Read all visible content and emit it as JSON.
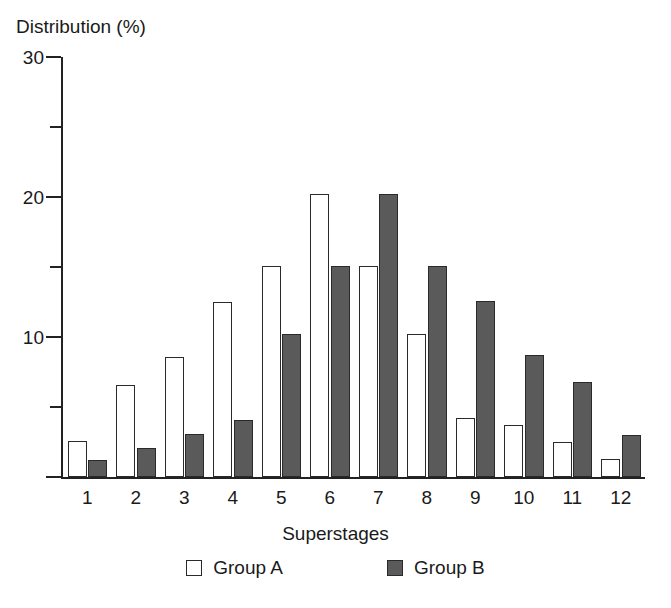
{
  "chart_data": {
    "type": "bar",
    "title": "",
    "xlabel": "Superstages",
    "ylabel": "Distribution (%)",
    "categories": [
      "1",
      "2",
      "3",
      "4",
      "5",
      "6",
      "7",
      "8",
      "9",
      "10",
      "11",
      "12"
    ],
    "series": [
      {
        "name": "Group A",
        "color": "#ffffff",
        "values": [
          2.6,
          6.6,
          8.6,
          12.5,
          15.1,
          20.2,
          15.1,
          10.2,
          4.2,
          3.7,
          2.5,
          1.3
        ]
      },
      {
        "name": "Group B",
        "color": "#5a5a5a",
        "values": [
          1.2,
          2.1,
          3.1,
          4.1,
          10.2,
          15.1,
          20.2,
          15.1,
          12.6,
          8.7,
          6.8,
          3.0
        ]
      }
    ],
    "ylim": [
      0,
      30
    ],
    "y_major_ticks": [
      0,
      10,
      20,
      30
    ],
    "y_major_tick_labels": [
      "",
      "10",
      "20",
      "30"
    ],
    "y_minor_ticks": [
      5,
      15,
      25
    ],
    "grid": false,
    "legend_position": "bottom",
    "axis_color": "#222222"
  },
  "axis": {
    "y_title": "Distribution (%)",
    "x_title": "Superstages",
    "y_tick_labels": [
      "30",
      "20",
      "10"
    ]
  },
  "legend": {
    "items": [
      {
        "label": "Group A",
        "swatch": "open-square-icon"
      },
      {
        "label": "Group B",
        "swatch": "filled-square-icon"
      }
    ]
  }
}
